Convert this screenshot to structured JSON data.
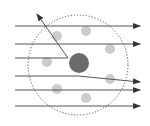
{
  "diagram": {
    "type": "scattering-diagram",
    "colors": {
      "background": "#ffffff",
      "ray": "#555555",
      "nucleus": "#6a6a6a",
      "electron": "#cccccc",
      "boundary": "#555555"
    },
    "boundary_circle": {
      "cx": 78,
      "cy": 65,
      "r": 50,
      "style": "dotted"
    },
    "nucleus": {
      "cx": 79,
      "cy": 63,
      "r": 10
    },
    "electrons": [
      {
        "cx": 57,
        "cy": 36,
        "r": 5
      },
      {
        "cx": 86,
        "cy": 31,
        "r": 5
      },
      {
        "cx": 110,
        "cy": 49,
        "r": 5
      },
      {
        "cx": 47,
        "cy": 62,
        "r": 5
      },
      {
        "cx": 110,
        "cy": 79,
        "r": 5
      },
      {
        "cx": 57,
        "cy": 89,
        "r": 5
      },
      {
        "cx": 86,
        "cy": 98,
        "r": 5
      }
    ],
    "rays": [
      {
        "points": [
          [
            15,
            26
          ],
          [
            140,
            26
          ]
        ],
        "label": "undeflected"
      },
      {
        "points": [
          [
            15,
            44
          ],
          [
            140,
            44
          ]
        ],
        "label": "undeflected"
      },
      {
        "points": [
          [
            15,
            58
          ],
          [
            68,
            58
          ],
          [
            37,
            14
          ]
        ],
        "label": "back-scattered"
      },
      {
        "points": [
          [
            15,
            76
          ],
          [
            78,
            76
          ],
          [
            140,
            82
          ]
        ],
        "label": "slightly-deflected"
      },
      {
        "points": [
          [
            15,
            90
          ],
          [
            140,
            90
          ]
        ],
        "label": "undeflected"
      },
      {
        "points": [
          [
            15,
            106
          ],
          [
            140,
            106
          ]
        ],
        "label": "undeflected"
      }
    ]
  }
}
